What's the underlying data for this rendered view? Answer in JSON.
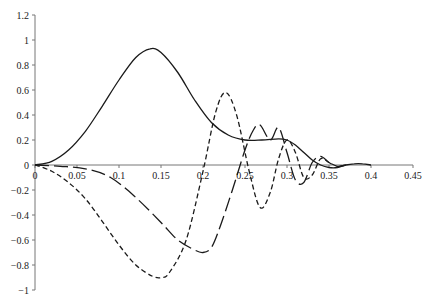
{
  "chart_data": {
    "type": "line",
    "title": "",
    "xlabel": "",
    "ylabel": "",
    "xlim": [
      0,
      0.45
    ],
    "ylim": [
      -1,
      1.2
    ],
    "grid": false,
    "legend": null,
    "x_ticks": [
      "0",
      "0.05",
      "0.1",
      "0.15",
      "0.2",
      "0.25",
      "0.3",
      "0.35",
      "0.4",
      "0.45"
    ],
    "y_ticks": [
      "1.2",
      "1",
      "0.8",
      "0.6",
      "0.4",
      "0.2",
      "0",
      "-0.2",
      "-0.4",
      "-0.6",
      "-0.8",
      "-1"
    ],
    "series": [
      {
        "name": "solid",
        "style": "solid",
        "x": [
          0,
          0.02,
          0.04,
          0.06,
          0.08,
          0.1,
          0.12,
          0.137,
          0.15,
          0.17,
          0.19,
          0.21,
          0.23,
          0.25,
          0.27,
          0.29,
          0.3,
          0.31,
          0.32,
          0.33,
          0.34,
          0.35,
          0.36,
          0.37,
          0.38,
          0.39,
          0.4
        ],
        "y": [
          0,
          0.03,
          0.12,
          0.27,
          0.47,
          0.68,
          0.86,
          0.93,
          0.9,
          0.74,
          0.52,
          0.34,
          0.24,
          0.2,
          0.2,
          0.21,
          0.2,
          0.16,
          0.1,
          0.04,
          0.0,
          -0.02,
          -0.02,
          0.0,
          0.01,
          0.01,
          0.0
        ]
      },
      {
        "name": "short-dashed",
        "style": "short-dash",
        "x": [
          0,
          0.02,
          0.04,
          0.06,
          0.08,
          0.1,
          0.12,
          0.14,
          0.151,
          0.16,
          0.18,
          0.2,
          0.215,
          0.227,
          0.24,
          0.255,
          0.268,
          0.28,
          0.29,
          0.3,
          0.31,
          0.32,
          0.33,
          0.34,
          0.35,
          0.36,
          0.37
        ],
        "y": [
          0,
          -0.05,
          -0.14,
          -0.27,
          -0.45,
          -0.64,
          -0.8,
          -0.89,
          -0.9,
          -0.86,
          -0.6,
          -0.05,
          0.42,
          0.58,
          0.4,
          -0.05,
          -0.34,
          -0.22,
          0.05,
          0.2,
          0.1,
          -0.1,
          -0.08,
          0.05,
          0.02,
          -0.01,
          0.0
        ]
      },
      {
        "name": "long-dashed",
        "style": "long-dash",
        "x": [
          0,
          0.03,
          0.06,
          0.09,
          0.12,
          0.15,
          0.17,
          0.19,
          0.2,
          0.21,
          0.22,
          0.235,
          0.25,
          0.26,
          0.268,
          0.28,
          0.29,
          0.3,
          0.31,
          0.32,
          0.33,
          0.34,
          0.35,
          0.36,
          0.37
        ],
        "y": [
          0,
          -0.01,
          -0.03,
          -0.1,
          -0.26,
          -0.46,
          -0.6,
          -0.68,
          -0.7,
          -0.66,
          -0.5,
          -0.2,
          0.12,
          0.28,
          0.32,
          0.2,
          0.3,
          0.1,
          -0.12,
          -0.14,
          0.02,
          0.07,
          0.02,
          -0.01,
          0.0
        ]
      }
    ]
  }
}
